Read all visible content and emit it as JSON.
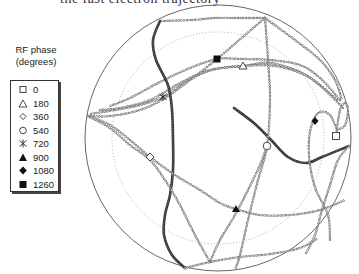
{
  "header_fragment": "the fast electron trajectory",
  "legend": {
    "title_line1": "RF phase",
    "title_line2": "(degrees)",
    "items": [
      {
        "label": "0",
        "marker": "open-square"
      },
      {
        "label": "180",
        "marker": "open-triangle"
      },
      {
        "label": "360",
        "marker": "open-diamond"
      },
      {
        "label": "540",
        "marker": "open-circle"
      },
      {
        "label": "720",
        "marker": "asterisk"
      },
      {
        "label": "900",
        "marker": "filled-triangle"
      },
      {
        "label": "1080",
        "marker": "filled-diamond"
      },
      {
        "label": "1260",
        "marker": "filled-square"
      }
    ]
  },
  "chart_data": {
    "type": "scatter",
    "title": "",
    "outer_circle": {
      "cx": 218,
      "cy": 138,
      "r": 133
    },
    "inner_dotted_circle": {
      "cx": 218,
      "cy": 138,
      "r": 106
    },
    "legend_position": "left",
    "grid": false,
    "phase_markers": [
      {
        "phase": 0,
        "marker": "open-square",
        "x": 336,
        "y": 136
      },
      {
        "phase": 180,
        "marker": "open-triangle",
        "x": 243,
        "y": 66
      },
      {
        "phase": 360,
        "marker": "open-diamond",
        "x": 150,
        "y": 157
      },
      {
        "phase": 540,
        "marker": "open-circle",
        "x": 267,
        "y": 146
      },
      {
        "phase": 720,
        "marker": "asterisk",
        "x": 163,
        "y": 97
      },
      {
        "phase": 900,
        "marker": "filled-triangle",
        "x": 236,
        "y": 209
      },
      {
        "phase": 1080,
        "marker": "filled-diamond",
        "x": 315,
        "y": 121
      },
      {
        "phase": 1260,
        "marker": "filled-square",
        "x": 217,
        "y": 59
      }
    ],
    "segments": [
      {
        "style": "bold",
        "points": [
          [
            234,
            108
          ],
          [
            255,
            124
          ],
          [
            272,
            141
          ],
          [
            288,
            157
          ],
          [
            306,
            163
          ],
          [
            322,
            157
          ],
          [
            349,
            146
          ]
        ]
      },
      {
        "style": "chain",
        "points": [
          [
            349,
            146
          ],
          [
            338,
            160
          ],
          [
            330,
            185
          ],
          [
            322,
            210
          ],
          [
            315,
            235
          ],
          [
            305,
            255
          ]
        ]
      },
      {
        "style": "chain",
        "points": [
          [
            336,
            136
          ],
          [
            340,
            110
          ],
          [
            345,
            103
          ],
          [
            348,
            110
          ],
          [
            345,
            125
          ],
          [
            337,
            130
          ]
        ]
      },
      {
        "style": "chain",
        "points": [
          [
            337,
            130
          ],
          [
            330,
            115
          ],
          [
            320,
            112
          ],
          [
            313,
            121
          ],
          [
            309,
            140
          ],
          [
            310,
            165
          ],
          [
            316,
            190
          ],
          [
            328,
            215
          ],
          [
            330,
            240
          ]
        ]
      },
      {
        "style": "chain",
        "points": [
          [
            337,
            100
          ],
          [
            320,
            85
          ],
          [
            300,
            72
          ],
          [
            270,
            63
          ],
          [
            243,
            66
          ],
          [
            210,
            70
          ],
          [
            180,
            83
          ],
          [
            150,
            100
          ],
          [
            120,
            108
          ],
          [
            100,
            110
          ]
        ]
      },
      {
        "style": "chain",
        "points": [
          [
            340,
            100
          ],
          [
            320,
            78
          ],
          [
            300,
            65
          ],
          [
            270,
            60
          ],
          [
            240,
            59
          ],
          [
            217,
            59
          ],
          [
            190,
            68
          ],
          [
            160,
            82
          ],
          [
            130,
            98
          ],
          [
            110,
            106
          ]
        ]
      },
      {
        "style": "chain",
        "points": [
          [
            343,
            108
          ],
          [
            325,
            90
          ],
          [
            305,
            75
          ],
          [
            275,
            66
          ],
          [
            243,
            66
          ],
          [
            212,
            70
          ],
          [
            185,
            82
          ],
          [
            163,
            97
          ],
          [
            140,
            105
          ],
          [
            115,
            110
          ],
          [
            90,
            114
          ]
        ]
      },
      {
        "style": "chain",
        "points": [
          [
            265,
            18
          ],
          [
            245,
            35
          ],
          [
            217,
            59
          ],
          [
            190,
            80
          ],
          [
            165,
            98
          ],
          [
            140,
            110
          ],
          [
            110,
            116
          ],
          [
            88,
            116
          ]
        ]
      },
      {
        "style": "chain",
        "points": [
          [
            265,
            18
          ],
          [
            240,
            18
          ],
          [
            215,
            18
          ],
          [
            192,
            20
          ],
          [
            160,
            21
          ]
        ]
      },
      {
        "style": "chain",
        "points": [
          [
            265,
            18
          ],
          [
            268,
            60
          ],
          [
            270,
            100
          ],
          [
            267,
            146
          ],
          [
            258,
            180
          ],
          [
            248,
            220
          ],
          [
            240,
            255
          ],
          [
            235,
            270
          ]
        ]
      },
      {
        "style": "chain",
        "points": [
          [
            265,
            18
          ],
          [
            295,
            40
          ],
          [
            320,
            60
          ],
          [
            335,
            80
          ],
          [
            342,
            100
          ]
        ]
      },
      {
        "style": "bold",
        "points": [
          [
            160,
            21
          ],
          [
            153,
            40
          ],
          [
            156,
            60
          ],
          [
            168,
            85
          ],
          [
            172,
            110
          ],
          [
            173,
            140
          ],
          [
            173,
            170
          ],
          [
            170,
            195
          ],
          [
            165,
            215
          ],
          [
            164,
            235
          ],
          [
            172,
            255
          ],
          [
            185,
            268
          ]
        ]
      },
      {
        "style": "chain",
        "points": [
          [
            88,
            116
          ],
          [
            110,
            125
          ],
          [
            130,
            140
          ],
          [
            150,
            157
          ],
          [
            175,
            175
          ],
          [
            200,
            190
          ],
          [
            220,
            203
          ],
          [
            236,
            209
          ],
          [
            260,
            215
          ],
          [
            290,
            215
          ],
          [
            320,
            210
          ],
          [
            345,
            200
          ]
        ]
      },
      {
        "style": "chain",
        "points": [
          [
            88,
            116
          ],
          [
            110,
            128
          ],
          [
            130,
            145
          ],
          [
            150,
            160
          ],
          [
            165,
            180
          ],
          [
            180,
            205
          ],
          [
            195,
            235
          ],
          [
            210,
            262
          ]
        ]
      },
      {
        "style": "chain",
        "points": [
          [
            210,
            262
          ],
          [
            220,
            240
          ],
          [
            235,
            215
          ],
          [
            248,
            190
          ],
          [
            260,
            165
          ],
          [
            267,
            146
          ]
        ]
      },
      {
        "style": "chain",
        "points": [
          [
            185,
            268
          ],
          [
            210,
            262
          ],
          [
            240,
            257
          ],
          [
            270,
            254
          ],
          [
            300,
            248
          ],
          [
            318,
            238
          ]
        ]
      }
    ]
  }
}
